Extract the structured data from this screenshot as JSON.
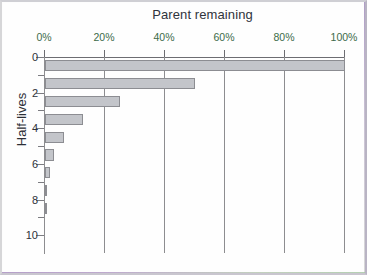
{
  "figure": {
    "background_color": "#fefefe",
    "bar_fill_color": "#c3c5ca",
    "bar_edge_color": "#8c8d92",
    "grid_color": "#8d8d90",
    "xlabel_color": "#3c6b4a",
    "ylabel_color": "#2f333a"
  },
  "chart_data": {
    "type": "bar",
    "orientation": "horizontal",
    "title": "Parent remaining",
    "xlabel": "Parent remaining",
    "ylabel": "Half-lives",
    "xlim": [
      0,
      100
    ],
    "ylim": [
      10.5,
      -0.5
    ],
    "grid": true,
    "grid_axis": "x",
    "legend": false,
    "xaxis_position": "top",
    "xticks": [
      0,
      20,
      40,
      60,
      80,
      100
    ],
    "xtick_labels": [
      "0%",
      "20%",
      "40%",
      "60%",
      "80%",
      "100%"
    ],
    "yticks": [
      0,
      1,
      2,
      3,
      4,
      5,
      6,
      7,
      8,
      9,
      10
    ],
    "ytick_labels": [
      "0",
      "",
      "2",
      "",
      "4",
      "",
      "6",
      "",
      "8",
      "",
      "10"
    ],
    "ytick_labels_shown": [
      "0",
      "2",
      "4",
      "6",
      "8",
      "10"
    ],
    "categories": [
      "0",
      "1",
      "2",
      "3",
      "4",
      "5",
      "6",
      "7",
      "8",
      "9",
      "10"
    ],
    "values": [
      100,
      50,
      25,
      12.5,
      6.25,
      3.125,
      1.5625,
      0.78125,
      0.390625,
      0.1953125,
      0.09765625
    ],
    "value_labels": [
      "100%",
      "50%",
      "25%",
      "12.5%",
      "6.25%",
      "3.13%",
      "1.56%",
      "0.78%",
      "0.39%",
      "0.20%",
      "0.10%"
    ],
    "series": [
      {
        "name": "Parent remaining",
        "values": [
          100,
          50,
          25,
          12.5,
          6.25,
          3.125,
          1.5625,
          0.78125,
          0.390625,
          0.1953125,
          0.09765625
        ]
      }
    ],
    "annotation": "Each successive half-life retains one half of the previous parent fraction (exponential decay)."
  },
  "xticks_render": [
    {
      "label": "0%",
      "value": 0
    },
    {
      "label": "20%",
      "value": 20
    },
    {
      "label": "40%",
      "value": 40
    },
    {
      "label": "60%",
      "value": 60
    },
    {
      "label": "80%",
      "value": 80
    },
    {
      "label": "100%",
      "value": 100
    }
  ],
  "yticks_render": [
    {
      "label": "0",
      "value": 0,
      "major": true
    },
    {
      "label": "",
      "value": 1,
      "major": false
    },
    {
      "label": "2",
      "value": 2,
      "major": true
    },
    {
      "label": "",
      "value": 3,
      "major": false
    },
    {
      "label": "4",
      "value": 4,
      "major": true
    },
    {
      "label": "",
      "value": 5,
      "major": false
    },
    {
      "label": "6",
      "value": 6,
      "major": true
    },
    {
      "label": "",
      "value": 7,
      "major": false
    },
    {
      "label": "8",
      "value": 8,
      "major": true
    },
    {
      "label": "",
      "value": 9,
      "major": false
    },
    {
      "label": "10",
      "value": 10,
      "major": true
    }
  ]
}
